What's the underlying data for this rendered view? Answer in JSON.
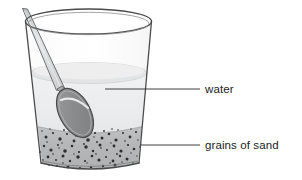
{
  "figure": {
    "background_color": "#ffffff",
    "width": 302,
    "height": 179
  },
  "labels": [
    {
      "id": "water",
      "text": "water",
      "text_x": 205,
      "text_y": 92,
      "leader": {
        "x1": 105,
        "y1": 89,
        "x2": 200,
        "y2": 89
      }
    },
    {
      "id": "grains-of-sand",
      "text": "grains of sand",
      "text_x": 205,
      "text_y": 149,
      "leader": {
        "x1": 141,
        "y1": 145,
        "x2": 200,
        "y2": 145
      }
    }
  ],
  "objects": {
    "glass": {
      "name": "glass tumbler",
      "outline_color": "#4a4a4a",
      "rim_top_y": 16,
      "bottom_y": 166,
      "rim_left_x": 25,
      "rim_right_x": 152,
      "base_left_x": 41,
      "base_right_x": 139
    },
    "water": {
      "name": "water body",
      "surface_y": 72,
      "fill_color": "#eceded",
      "surface_color": "#d8d9da"
    },
    "sand": {
      "name": "sand layer",
      "top_y": 128,
      "fill_color": "#b9babb",
      "grain_color": "#2f2f2f",
      "grain_count": 86
    },
    "spoon": {
      "name": "spoon",
      "handle_color": "#d6d7d8",
      "bowl_color": "#8d8e8f",
      "outline_color": "#4a4a4a",
      "handle_tip_x": 22,
      "handle_tip_y": 9,
      "bowl_center_x": 75,
      "bowl_center_y": 110
    }
  },
  "colors": {
    "ink": "#2b2b2b",
    "text": "#1d1d1d",
    "glass_stroke": "#4a4a4a",
    "water_fill": "#eceded",
    "sand_fill": "#b9babb",
    "grain": "#2f2f2f",
    "spoon_bowl": "#8d8e8f",
    "spoon_handle": "#d6d7d8"
  }
}
